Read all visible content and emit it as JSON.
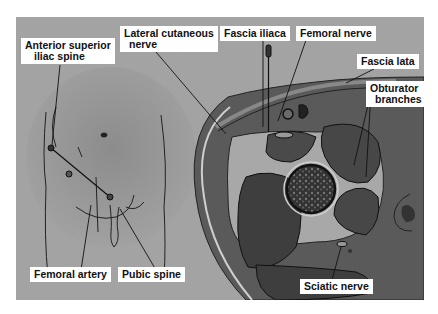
{
  "diagram": {
    "panels": [
      {
        "name": "surface-anatomy",
        "description": "Anterior view of lower abdomen and groin"
      },
      {
        "name": "cross-section",
        "description": "Transverse section of upper thigh with needle"
      }
    ],
    "labels": {
      "asis_line1": "Anterior superior",
      "asis_line2": "iliac spine",
      "lateral_cutaneous_line1": "Lateral cutaneous",
      "lateral_cutaneous_line2": "nerve",
      "fascia_iliaca": "Fascia iliaca",
      "femoral_nerve": "Femoral nerve",
      "fascia_lata": "Fascia lata",
      "obturator_line1": "Obturator",
      "obturator_line2": "branches",
      "femoral_artery": "Femoral artery",
      "pubic_spine": "Pubic spine",
      "sciatic_nerve": "Sciatic nerve"
    },
    "colors": {
      "background": "#a3a3a3",
      "label_bg": "#ffffff",
      "muscle": "#4a4a4a",
      "fascia": "#6e6e6e",
      "line": "#1a1a1a"
    }
  }
}
